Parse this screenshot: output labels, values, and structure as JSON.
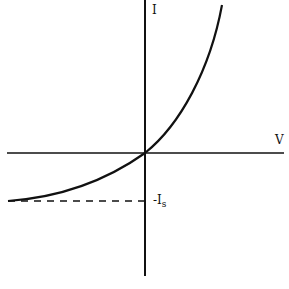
{
  "diagram": {
    "axes": {
      "y_label": "I",
      "x_label": "V"
    },
    "annotations": {
      "saturation_prefix": "-I",
      "saturation_subscript": "s"
    },
    "colors": {
      "line": "#111111",
      "background": "#ffffff"
    }
  }
}
